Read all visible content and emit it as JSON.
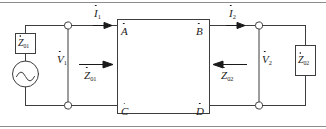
{
  "diagram": {
    "stroke_color": "#3d3d3d",
    "text_color": "#1a1a1a",
    "background": "#ffffff"
  },
  "source": {
    "symbol": "ac-voltage-source",
    "internal_impedance": {
      "base": "Z",
      "sub": "01",
      "dot": true
    },
    "output_voltage": {
      "base": "V",
      "sub": "1",
      "dot": true
    }
  },
  "currents": {
    "input": {
      "base": "I",
      "sub": "1",
      "dot": true,
      "direction": "right"
    },
    "output": {
      "base": "I",
      "sub": "2",
      "dot": true,
      "direction": "right"
    }
  },
  "voltages": {
    "input": {
      "base": "V",
      "sub": "1",
      "dot": true
    },
    "output": {
      "base": "V",
      "sub": "2",
      "dot": true
    }
  },
  "impedances": {
    "input_looking_in": {
      "base": "Z",
      "sub": "01",
      "dot": true,
      "arrow": "right"
    },
    "output_looking_back": {
      "base": "Z",
      "sub": "02",
      "dot": true,
      "arrow": "left"
    },
    "load": {
      "base": "Z",
      "sub": "02",
      "dot": true
    }
  },
  "network_nodes": {
    "top_left": {
      "base": "A",
      "dot": true
    },
    "top_right": {
      "base": "B",
      "dot": true
    },
    "bottom_left": {
      "base": "C",
      "dot": true
    },
    "bottom_right": {
      "base": "D",
      "dot": true
    }
  },
  "terminals": {
    "left_top": "open-circle-terminal",
    "left_bottom": "open-circle-terminal",
    "right_top": "open-circle-terminal",
    "right_bottom": "open-circle-terminal"
  }
}
